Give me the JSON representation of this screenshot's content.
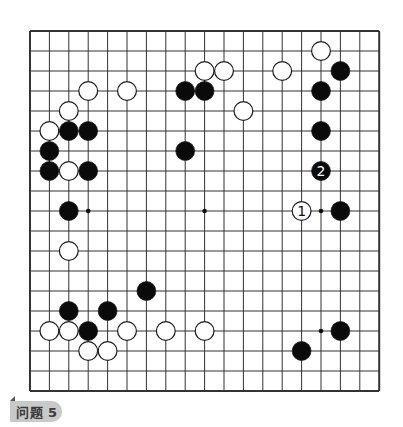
{
  "problem": {
    "label": "问题 5"
  },
  "board": {
    "size": 19,
    "origin_x": 30,
    "origin_y": 31,
    "spacing_x": 19.4,
    "spacing_y": 20,
    "line_color": "#333333",
    "hoshi": [
      [
        3,
        9
      ],
      [
        9,
        9
      ],
      [
        15,
        9
      ],
      [
        15,
        15
      ]
    ],
    "stones": [
      {
        "color": "white",
        "col": 15,
        "row": 1
      },
      {
        "color": "white",
        "col": 9,
        "row": 2
      },
      {
        "color": "white",
        "col": 10,
        "row": 2
      },
      {
        "color": "white",
        "col": 13,
        "row": 2
      },
      {
        "color": "black",
        "col": 16,
        "row": 2
      },
      {
        "color": "white",
        "col": 3,
        "row": 3
      },
      {
        "color": "white",
        "col": 5,
        "row": 3
      },
      {
        "color": "black",
        "col": 8,
        "row": 3
      },
      {
        "color": "black",
        "col": 9,
        "row": 3
      },
      {
        "color": "black",
        "col": 15,
        "row": 3
      },
      {
        "color": "white",
        "col": 2,
        "row": 4
      },
      {
        "color": "white",
        "col": 11,
        "row": 4
      },
      {
        "color": "white",
        "col": 1,
        "row": 5
      },
      {
        "color": "black",
        "col": 2,
        "row": 5
      },
      {
        "color": "black",
        "col": 3,
        "row": 5
      },
      {
        "color": "black",
        "col": 15,
        "row": 5
      },
      {
        "color": "black",
        "col": 1,
        "row": 6
      },
      {
        "color": "black",
        "col": 8,
        "row": 6
      },
      {
        "color": "black",
        "col": 1,
        "row": 7
      },
      {
        "color": "white",
        "col": 2,
        "row": 7
      },
      {
        "color": "black",
        "col": 3,
        "row": 7
      },
      {
        "color": "black",
        "col": 15,
        "row": 7,
        "number": "2"
      },
      {
        "color": "black",
        "col": 2,
        "row": 9
      },
      {
        "color": "white",
        "col": 14,
        "row": 9,
        "number": "1"
      },
      {
        "color": "black",
        "col": 16,
        "row": 9
      },
      {
        "color": "white",
        "col": 2,
        "row": 11
      },
      {
        "color": "black",
        "col": 6,
        "row": 13
      },
      {
        "color": "black",
        "col": 2,
        "row": 14
      },
      {
        "color": "black",
        "col": 4,
        "row": 14
      },
      {
        "color": "white",
        "col": 1,
        "row": 15
      },
      {
        "color": "white",
        "col": 2,
        "row": 15
      },
      {
        "color": "black",
        "col": 3,
        "row": 15
      },
      {
        "color": "white",
        "col": 5,
        "row": 15
      },
      {
        "color": "white",
        "col": 7,
        "row": 15
      },
      {
        "color": "white",
        "col": 9,
        "row": 15
      },
      {
        "color": "black",
        "col": 16,
        "row": 15
      },
      {
        "color": "white",
        "col": 3,
        "row": 16
      },
      {
        "color": "white",
        "col": 4,
        "row": 16
      },
      {
        "color": "black",
        "col": 14,
        "row": 16
      }
    ]
  }
}
